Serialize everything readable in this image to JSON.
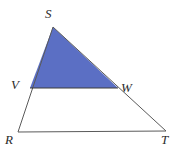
{
  "figure": {
    "background_color": "#ffffff",
    "stroke_color": "#5a5a5a",
    "stroke_width": 1,
    "shaded_region": {
      "name": "triangle-SVW",
      "fill_color": "#5B6FC4",
      "vertices": [
        "S",
        "V",
        "W"
      ]
    },
    "outer_triangle": {
      "name": "triangle-RST",
      "vertices": [
        "R",
        "S",
        "T"
      ]
    },
    "points": [
      {
        "id": "S",
        "label": "S",
        "x": 53,
        "y": 27,
        "label_x": 45,
        "label_y": 7
      },
      {
        "id": "V",
        "label": "V",
        "x": 30,
        "y": 88,
        "label_x": 11,
        "label_y": 78
      },
      {
        "id": "W",
        "label": "W",
        "x": 118,
        "y": 88,
        "label_x": 121,
        "label_y": 81
      },
      {
        "id": "R",
        "label": "R",
        "x": 18,
        "y": 132,
        "label_x": 5,
        "label_y": 133
      },
      {
        "id": "T",
        "label": "T",
        "x": 166,
        "y": 131,
        "label_x": 161,
        "label_y": 133
      }
    ],
    "segments": [
      {
        "name": "segment-SR",
        "from": "S",
        "to": "R"
      },
      {
        "name": "segment-ST",
        "from": "S",
        "to": "T"
      },
      {
        "name": "segment-RT",
        "from": "R",
        "to": "T"
      },
      {
        "name": "segment-VW",
        "from": "V",
        "to": "W"
      }
    ]
  }
}
